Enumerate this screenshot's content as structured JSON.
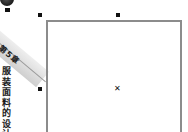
{
  "sidebar": {
    "chapter_label": "第5章",
    "title": "服装面料的设计"
  },
  "canvas": {
    "center_marker": "✕",
    "handles": [
      "top-left",
      "top-middle",
      "middle-left"
    ],
    "frame_color": "#8c8c8c",
    "handle_color": "#111111"
  }
}
